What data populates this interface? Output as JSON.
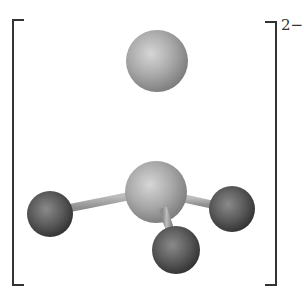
{
  "figure": {
    "type": "ball-and-stick molecular model",
    "geometry": "tetrahedral",
    "enclosure": "square brackets",
    "charge_label": "2−",
    "colors": {
      "background": "#ffffff",
      "bracket": "#333333",
      "light_atom": "#a9a9a9",
      "light_atom_highlight": "#d6d6d6",
      "light_atom_shadow": "#7c7c7c",
      "dark_atom": "#5a5a5a",
      "dark_atom_highlight": "#8a8a8a",
      "dark_atom_shadow": "#2e2e2e",
      "bond": "#a3a3a3"
    },
    "atoms": [
      {
        "id": "top",
        "shade": "light",
        "cx": 157,
        "cy": 61,
        "r": 31
      },
      {
        "id": "center",
        "shade": "light",
        "cx": 156,
        "cy": 192,
        "r": 31
      },
      {
        "id": "left",
        "shade": "dark",
        "cx": 50,
        "cy": 214,
        "r": 23
      },
      {
        "id": "right",
        "shade": "dark",
        "cx": 232,
        "cy": 209,
        "r": 23
      },
      {
        "id": "bottom",
        "shade": "dark",
        "cx": 176,
        "cy": 250,
        "r": 24
      }
    ],
    "bonds": [
      {
        "from": "center",
        "to": "top"
      },
      {
        "from": "center",
        "to": "left"
      },
      {
        "from": "center",
        "to": "right"
      },
      {
        "from": "center",
        "to": "bottom"
      }
    ]
  }
}
